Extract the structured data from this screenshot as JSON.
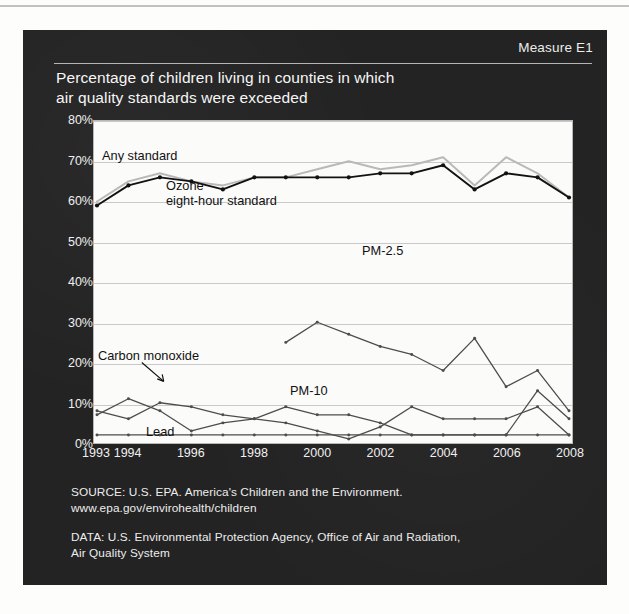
{
  "header": {
    "measure_tag": "Measure E1",
    "title": "Percentage of children living in counties in which\nair quality standards were exceeded"
  },
  "footer": {
    "source": "SOURCE: U.S. EPA. America's Children and the Environment.\nwww.epa.gov/envirohealth/children",
    "data": "DATA: U.S. Environmental Protection Agency, Office of Air and Radiation,\nAir Quality System"
  },
  "annotations": {
    "any_standard": "Any standard",
    "ozone": "Ozone\neight-hour standard",
    "pm25": "PM-2.5",
    "pm10": "PM-10",
    "carbon_monoxide": "Carbon monoxide",
    "lead": "Lead"
  },
  "colors": {
    "panel_background": "#232323",
    "plot_background": "#fbfbfa",
    "gridline": "#c9c9c9",
    "any_standard_line": "#b9b9b9",
    "ozone_line": "#121212",
    "pm25_line": "#4d4d4d",
    "pm10_line": "#4d4d4d",
    "carbon_monoxide_line": "#4d4d4d",
    "lead_line": "#4d4d4d",
    "text_light": "#f0f0f0",
    "text_dark": "#111111"
  },
  "chart_data": {
    "type": "line",
    "title": "Percentage of children living in counties in which air quality standards were exceeded",
    "xlabel": "",
    "ylabel": "",
    "ylim": [
      0,
      80
    ],
    "yticks": [
      0,
      10,
      20,
      30,
      40,
      50,
      60,
      70,
      80
    ],
    "ytick_labels": [
      "0%",
      "10%",
      "20%",
      "30%",
      "40%",
      "50%",
      "60%",
      "70%",
      "80%"
    ],
    "xlim": [
      1993,
      2008
    ],
    "x": [
      1993,
      1994,
      1995,
      1996,
      1997,
      1998,
      1999,
      2000,
      2001,
      2002,
      2003,
      2004,
      2005,
      2006,
      2007,
      2008
    ],
    "xtick_labels": [
      "1993",
      "1994",
      "1996",
      "1998",
      "2000",
      "2002",
      "2004",
      "2006",
      "2008"
    ],
    "xticks": [
      1993,
      1994,
      1996,
      1998,
      2000,
      2002,
      2004,
      2006,
      2008
    ],
    "grid": true,
    "legend": "inline-annotations",
    "series": [
      {
        "name": "Any standard",
        "label": "Any standard",
        "color": "#b9b9b9",
        "values": [
          60,
          65,
          67,
          65,
          64,
          66,
          66,
          68,
          70,
          68,
          69,
          71,
          64,
          71,
          67,
          61
        ]
      },
      {
        "name": "Ozone eight-hour standard",
        "label": "Ozone\neight-hour standard",
        "color": "#121212",
        "values": [
          59,
          64,
          66,
          65,
          63,
          66,
          66,
          66,
          66,
          67,
          67,
          69,
          63,
          67,
          66,
          61
        ]
      },
      {
        "name": "PM-2.5",
        "label": "PM-2.5",
        "color": "#4d4d4d",
        "values": [
          null,
          null,
          null,
          null,
          null,
          null,
          25,
          30,
          27,
          24,
          22,
          18,
          26,
          14,
          18,
          8
        ]
      },
      {
        "name": "PM-10",
        "label": "PM-10",
        "color": "#4d4d4d",
        "values": [
          8,
          6,
          10,
          9,
          7,
          6,
          9,
          7,
          7,
          5,
          2,
          2,
          2,
          2,
          13,
          6
        ]
      },
      {
        "name": "Carbon monoxide",
        "label": "Carbon monoxide",
        "color": "#4d4d4d",
        "values": [
          7,
          11,
          8,
          3,
          5,
          6,
          5,
          3,
          1,
          4,
          9,
          6,
          6,
          6,
          9,
          2
        ]
      },
      {
        "name": "Lead",
        "label": "Lead",
        "color": "#4d4d4d",
        "values": [
          2,
          2,
          2,
          2,
          2,
          2,
          2,
          2,
          2,
          2,
          2,
          2,
          2,
          2,
          2,
          2
        ]
      }
    ]
  }
}
